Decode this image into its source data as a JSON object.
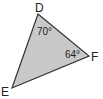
{
  "figure": {
    "type": "triangle",
    "fill_color": "#c8c8c8",
    "stroke_color": "#333333",
    "vertices": [
      {
        "name": "D",
        "x": 38,
        "y": 14
      },
      {
        "name": "F",
        "x": 89,
        "y": 56
      },
      {
        "name": "E",
        "x": 12,
        "y": 88
      }
    ],
    "labels": {
      "D": "D",
      "E": "E",
      "F": "F"
    },
    "angles": {
      "D": "70°",
      "F": "64°"
    }
  }
}
